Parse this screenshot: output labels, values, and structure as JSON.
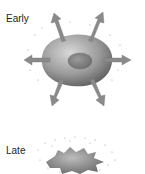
{
  "labels": {
    "early": "Early",
    "late": "Late"
  },
  "colors": {
    "cell_light": "#c8c8c8",
    "cell_dark": "#6a6a6a",
    "arrow": "#8a8a8a",
    "dots": "#9a9a9a"
  }
}
